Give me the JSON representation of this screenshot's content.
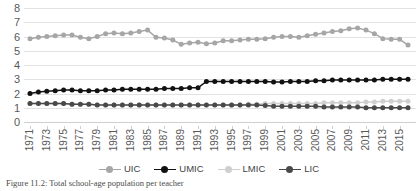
{
  "figure": {
    "caption": "Figure 11.2: Total school-age population per teacher"
  },
  "legend": {
    "position": "bottom-center",
    "items": [
      {
        "label": "UIC",
        "color": "#a6a6a6"
      },
      {
        "label": "UMIC",
        "color": "#111111"
      },
      {
        "label": "LMIC",
        "color": "#cfcfcf"
      },
      {
        "label": "LIC",
        "color": "#494949"
      }
    ]
  },
  "chart_data": {
    "type": "line",
    "title": "",
    "xlabel": "",
    "ylabel": "",
    "ylim": [
      0,
      8
    ],
    "yticks": [
      0,
      1,
      2,
      3,
      4,
      5,
      6,
      7,
      8
    ],
    "grid": true,
    "x": [
      1971,
      1972,
      1973,
      1974,
      1975,
      1976,
      1977,
      1978,
      1979,
      1980,
      1981,
      1982,
      1983,
      1984,
      1985,
      1986,
      1987,
      1988,
      1989,
      1990,
      1991,
      1992,
      1993,
      1994,
      1995,
      1996,
      1997,
      1998,
      1999,
      2000,
      2001,
      2002,
      2003,
      2004,
      2005,
      2006,
      2007,
      2008,
      2009,
      2010,
      2011,
      2012,
      2013,
      2014,
      2015,
      2016
    ],
    "xticks": [
      1971,
      1973,
      1975,
      1977,
      1979,
      1981,
      1983,
      1985,
      1987,
      1989,
      1991,
      1993,
      1995,
      1997,
      1999,
      2001,
      2003,
      2005,
      2007,
      2009,
      2011,
      2013,
      2015
    ],
    "series": [
      {
        "name": "UIC",
        "color": "#a6a6a6",
        "values": [
          5.85,
          5.95,
          6.0,
          6.05,
          6.1,
          6.1,
          5.95,
          5.85,
          6.0,
          6.2,
          6.25,
          6.2,
          6.25,
          6.35,
          6.45,
          5.95,
          5.9,
          5.75,
          5.45,
          5.55,
          5.6,
          5.5,
          5.55,
          5.7,
          5.7,
          5.75,
          5.8,
          5.8,
          5.85,
          5.95,
          6.0,
          6.0,
          5.95,
          6.05,
          6.15,
          6.25,
          6.35,
          6.4,
          6.55,
          6.6,
          6.45,
          6.2,
          5.85,
          5.8,
          5.8,
          5.4
        ]
      },
      {
        "name": "UMIC",
        "color": "#111111",
        "values": [
          2.0,
          2.1,
          2.15,
          2.2,
          2.25,
          2.25,
          2.2,
          2.2,
          2.2,
          2.25,
          2.25,
          2.3,
          2.3,
          2.3,
          2.3,
          2.3,
          2.35,
          2.35,
          2.35,
          2.4,
          2.4,
          2.85,
          2.85,
          2.85,
          2.85,
          2.85,
          2.85,
          2.85,
          2.85,
          2.8,
          2.8,
          2.85,
          2.85,
          2.85,
          2.9,
          2.9,
          2.95,
          2.95,
          2.95,
          2.95,
          2.95,
          2.95,
          3.0,
          3.0,
          3.0,
          3.0
        ]
      },
      {
        "name": "LMIC",
        "color": "#cfcfcf",
        "values": [
          1.3,
          1.3,
          1.3,
          1.3,
          1.3,
          1.25,
          1.25,
          1.25,
          1.2,
          1.2,
          1.2,
          1.2,
          1.2,
          1.2,
          1.2,
          1.2,
          1.2,
          1.2,
          1.2,
          1.2,
          1.2,
          1.2,
          1.2,
          1.2,
          1.2,
          1.2,
          1.25,
          1.25,
          1.3,
          1.3,
          1.3,
          1.3,
          1.3,
          1.3,
          1.3,
          1.35,
          1.35,
          1.35,
          1.35,
          1.35,
          1.4,
          1.4,
          1.45,
          1.45,
          1.45,
          1.45
        ]
      },
      {
        "name": "LIC",
        "color": "#494949",
        "values": [
          1.3,
          1.3,
          1.3,
          1.3,
          1.3,
          1.25,
          1.25,
          1.25,
          1.2,
          1.2,
          1.2,
          1.2,
          1.2,
          1.2,
          1.2,
          1.2,
          1.2,
          1.2,
          1.2,
          1.2,
          1.2,
          1.2,
          1.2,
          1.2,
          1.2,
          1.2,
          1.2,
          1.2,
          1.15,
          1.1,
          1.1,
          1.1,
          1.1,
          1.1,
          1.1,
          1.05,
          1.05,
          1.05,
          1.05,
          1.05,
          1.0,
          1.0,
          1.0,
          1.0,
          1.0,
          1.0
        ]
      }
    ]
  }
}
